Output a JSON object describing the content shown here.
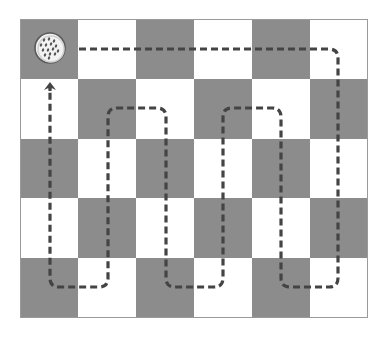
{
  "diagram": {
    "type": "checkerboard-path",
    "grid": {
      "rows": 5,
      "cols": 6,
      "origin_x": 20,
      "origin_y": 19,
      "cell_width": 58,
      "cell_height": 59.8,
      "first_cell_dark": true,
      "colors": {
        "dark": "#8c8c8c",
        "light": "#ffffff",
        "border": "#9a9a9a"
      }
    },
    "start_marker": {
      "name": "dimpled-ball",
      "cx": 50,
      "cy": 48,
      "r": 15,
      "fill": "#f2f2f2",
      "stroke": "#5a5a5a"
    },
    "path": {
      "style": "dashed",
      "color": "#444444",
      "width": 3.2,
      "dash": "7 4",
      "corner_radius": 9,
      "points": [
        [
          79,
          49
        ],
        [
          338,
          49
        ],
        [
          338,
          287
        ],
        [
          281,
          287
        ],
        [
          281,
          108
        ],
        [
          223,
          108
        ],
        [
          223,
          287
        ],
        [
          166,
          287
        ],
        [
          166,
          108
        ],
        [
          108,
          108
        ],
        [
          108,
          287
        ],
        [
          50,
          287
        ],
        [
          50,
          88
        ]
      ],
      "end_arrow": {
        "x": 50,
        "tip_y": 82,
        "direction": "up"
      }
    }
  }
}
